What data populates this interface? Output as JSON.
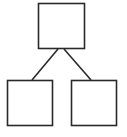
{
  "diagram": {
    "type": "tree",
    "stroke_color": "#2a2a2a",
    "background": "#ffffff",
    "nodes": [
      {
        "id": "root",
        "label": "",
        "x": 38,
        "y": 3,
        "w": 47,
        "h": 46
      },
      {
        "id": "left-child",
        "label": "",
        "x": 7,
        "y": 80,
        "w": 46,
        "h": 46
      },
      {
        "id": "right-child",
        "label": "",
        "x": 71,
        "y": 80,
        "w": 46,
        "h": 46
      }
    ],
    "edges": [
      {
        "from": "root",
        "to": "left-child"
      },
      {
        "from": "root",
        "to": "right-child"
      }
    ]
  }
}
